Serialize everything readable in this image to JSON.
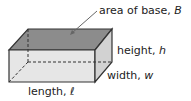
{
  "diagram": {
    "type": "rectangular-prism",
    "labels": {
      "base": {
        "text": "area of base, ",
        "var": "B"
      },
      "height": {
        "text": "height, ",
        "var": "h"
      },
      "width": {
        "text": "width, ",
        "var": "w"
      },
      "length": {
        "text": "length, ",
        "var": "ℓ"
      }
    },
    "colors": {
      "top_face": "#8c8c8c",
      "front_face": "#e6e6e6",
      "right_face": "#d2d2d2",
      "edge": "#333333"
    }
  }
}
